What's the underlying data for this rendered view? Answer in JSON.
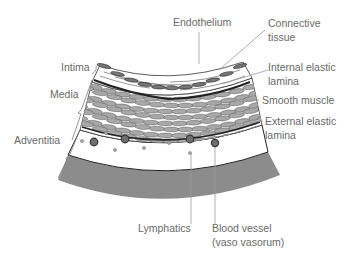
{
  "diagram": {
    "labels": {
      "endothelium": "Endothelium",
      "connective_tissue": [
        "Connective",
        "tissue"
      ],
      "internal_elastic_lamina": [
        "Internal elastic",
        "lamina"
      ],
      "smooth_muscle": "Smooth muscle",
      "external_elastic_lamina": [
        "External elastic",
        "lamina"
      ],
      "intima": "Intima",
      "media": "Media",
      "adventitia": "Adventitia",
      "lymphatics": "Lymphatics",
      "blood_vessel": [
        "Blood vessel",
        "(vaso vasorum)"
      ]
    },
    "colors": {
      "label_text": "#6a6a6a",
      "leader_line": "#9a9a9a",
      "outer_band": "#8c8c8c",
      "muscle_cell": "#a8a8a8",
      "outline": "#333333",
      "vessel": "#6e6e6e"
    }
  }
}
